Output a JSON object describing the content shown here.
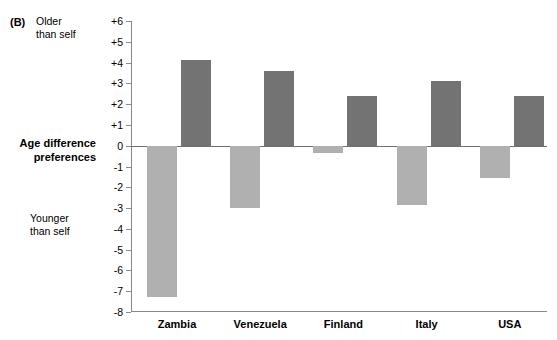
{
  "panel": {
    "label": "(B)"
  },
  "annotations": {
    "older": "Older\nthan self",
    "older_line1": "Older",
    "older_line2": "than self",
    "younger_line1": "Younger",
    "younger_line2": "than self",
    "axis_title_line1": "Age difference",
    "axis_title_line2": "preferences"
  },
  "colors": {
    "positive_bar": "#737373",
    "negative_bar": "#b0b0b0",
    "axis": "#8a8a8a",
    "zero_line": "#6f6f6f",
    "background": "#ffffff",
    "text": "#000000"
  },
  "chart_data": {
    "type": "bar",
    "title": "",
    "subtitle": "",
    "xlabel": "",
    "ylabel": "Age difference preferences",
    "ylim": [
      -8,
      6
    ],
    "ytick_labels": [
      "+6",
      "+5",
      "+4",
      "+3",
      "+2",
      "+1",
      "0",
      "-1",
      "-2",
      "-3",
      "-4",
      "-5",
      "-6",
      "-7",
      "-8"
    ],
    "ytick_values": [
      6,
      5,
      4,
      3,
      2,
      1,
      0,
      -1,
      -2,
      -3,
      -4,
      -5,
      -6,
      -7,
      -8
    ],
    "grid": false,
    "legend_position": "none",
    "categories": [
      "Zambia",
      "Venezuela",
      "Finland",
      "Italy",
      "USA"
    ],
    "series": [
      {
        "name": "Younger than self (negative preference)",
        "color": "#b0b0b0",
        "values": [
          -7.3,
          -3.0,
          -0.35,
          -2.85,
          -1.55
        ]
      },
      {
        "name": "Older than self (positive preference)",
        "color": "#737373",
        "values": [
          4.1,
          3.6,
          2.4,
          3.1,
          2.4
        ]
      }
    ],
    "annotations": [
      {
        "text": "Older than self",
        "position": "top-left-of-axis"
      },
      {
        "text": "Younger than self",
        "position": "bottom-left-of-axis"
      }
    ]
  }
}
